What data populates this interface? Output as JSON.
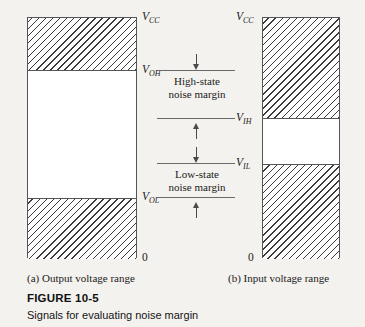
{
  "figure": {
    "number": "FIGURE 10-5",
    "caption": "Signals for evaluating noise margin"
  },
  "panels": {
    "a": {
      "sub_caption": "(a)  Output voltage range",
      "labels": {
        "top": {
          "symbol": "V",
          "sub": "CC"
        },
        "upper": {
          "symbol": "V",
          "sub": "OH"
        },
        "lower": {
          "symbol": "V",
          "sub": "OL"
        },
        "zero": "0"
      }
    },
    "b": {
      "sub_caption": "(b)  Input voltage range",
      "labels": {
        "top": {
          "symbol": "V",
          "sub": "CC"
        },
        "upper": {
          "symbol": "V",
          "sub": "IH"
        },
        "lower": {
          "symbol": "V",
          "sub": "IL"
        },
        "zero": "0"
      }
    }
  },
  "margins": {
    "high": {
      "line1": "High-state",
      "line2": "noise margin"
    },
    "low": {
      "line1": "Low-state",
      "line2": "noise margin"
    }
  },
  "colors": {
    "ink": "#1a1a1a",
    "rule": "#555555",
    "hatch": "#3a3a3a",
    "paper": "#f4f2ee"
  }
}
